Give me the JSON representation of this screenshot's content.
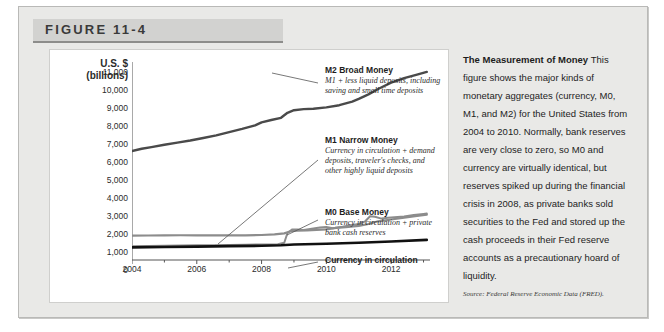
{
  "figure": {
    "label": "FIGURE 11-4"
  },
  "caption": {
    "heading": "The Measurement of",
    "heading2": "Money",
    "body": "This figure shows the major kinds of monetary aggregates (currency, M0, M1, and M2) for the United States from 2004 to 2010. Normally, bank reserves are very close to zero, so M0 and currency are virtually identical, but reserves spiked up during the financial crisis in 2008, as private banks sold securities to the Fed and stored up the cash proceeds in their Fed reserve accounts as a precautionary hoard of liquidity.",
    "source": "Source: Federal Reserve Economic Data (FRED)."
  },
  "callouts": [
    {
      "title": "M2 Broad Money",
      "desc": "M1 + less liquid deposits, including saving and small time deposits"
    },
    {
      "title": "M1 Narrow Money",
      "desc": "Currency in circulation + demand deposits, traveler's checks, and other highly liquid deposits"
    },
    {
      "title": "M0 Base Money",
      "desc": "Currency in circulation + private bank cash reserves"
    },
    {
      "title": "Currency in circulation",
      "desc": ""
    }
  ],
  "chart_data": {
    "type": "line",
    "title": "The Measurement of Money",
    "xlabel": "",
    "ylabel": "U.S. $ (billions)",
    "ylabel_line1": "U.S. $",
    "ylabel_line2": "(billions)",
    "xlim": [
      2004,
      2013.2
    ],
    "ylim": [
      0,
      11000
    ],
    "yticks": [
      0,
      1000,
      2000,
      3000,
      4000,
      5000,
      6000,
      7000,
      8000,
      9000,
      10000,
      11000
    ],
    "ytick_labels": [
      "0",
      "1,000",
      "2,000",
      "3,000",
      "4,000",
      "5,000",
      "6,000",
      "7,000",
      "8,000",
      "9,000",
      "10,000",
      "11,000"
    ],
    "xticks_major": [
      2004,
      2006,
      2008,
      2010,
      2012
    ],
    "xtick_labels": [
      "2004",
      "2006",
      "2008",
      "2010",
      "2012"
    ],
    "xticks_minor": [
      2005,
      2007,
      2009,
      2011,
      2013
    ],
    "grid": false,
    "legend": "inline-callouts",
    "colors": {
      "m2": "#4a4a4a",
      "m1": "#8c8c8c",
      "m0": "#8c8c8c",
      "currency": "#111111",
      "axis": "#555555",
      "panel_background": "#ffffff",
      "figure_background": "#e9e9e7",
      "header_background": "#d2d2d0"
    },
    "series": [
      {
        "name": "M2 Broad Money",
        "color": "#4a4a4a",
        "x": [
          2004.0,
          2004.3,
          2004.6,
          2005.0,
          2005.4,
          2005.8,
          2006.2,
          2006.6,
          2007.0,
          2007.4,
          2007.8,
          2008.0,
          2008.3,
          2008.6,
          2008.8,
          2009.0,
          2009.3,
          2009.6,
          2010.0,
          2010.4,
          2010.8,
          2011.0,
          2011.3,
          2011.6,
          2012.0,
          2012.4,
          2012.8,
          2013.1
        ],
        "values": [
          6050,
          6180,
          6270,
          6400,
          6520,
          6640,
          6780,
          6920,
          7100,
          7280,
          7480,
          7650,
          7780,
          7900,
          8180,
          8320,
          8380,
          8400,
          8480,
          8600,
          8800,
          8950,
          9200,
          9500,
          9850,
          10100,
          10300,
          10450
        ]
      },
      {
        "name": "M1 Narrow Money",
        "color": "#8c8c8c",
        "x": [
          2004.0,
          2004.5,
          2005.0,
          2005.5,
          2006.0,
          2006.5,
          2007.0,
          2007.5,
          2008.0,
          2008.4,
          2008.7,
          2008.9,
          2009.1,
          2009.4,
          2009.7,
          2010.0,
          2010.3,
          2010.6,
          2011.0,
          2011.3,
          2011.6,
          2012.0,
          2012.4,
          2012.8,
          2013.1
        ],
        "values": [
          1350,
          1360,
          1370,
          1375,
          1370,
          1365,
          1370,
          1370,
          1390,
          1420,
          1480,
          1600,
          1630,
          1650,
          1670,
          1700,
          1780,
          1830,
          1900,
          2000,
          2150,
          2250,
          2350,
          2450,
          2520
        ]
      },
      {
        "name": "M0 Base Money",
        "color": "#8c8c8c",
        "x": [
          2004.0,
          2004.5,
          2005.0,
          2005.5,
          2006.0,
          2006.5,
          2007.0,
          2007.5,
          2008.0,
          2008.5,
          2008.7,
          2008.8,
          2008.95,
          2009.1,
          2009.3,
          2009.5,
          2009.8,
          2010.0,
          2010.2,
          2010.5,
          2010.8,
          2011.0,
          2011.2,
          2011.35,
          2011.5,
          2011.7,
          2011.9,
          2012.1,
          2012.4,
          2012.7,
          2013.0,
          2013.1
        ],
        "values": [
          760,
          775,
          790,
          800,
          815,
          825,
          840,
          850,
          860,
          880,
          960,
          1500,
          1700,
          1700,
          1670,
          1720,
          1800,
          1830,
          1770,
          1850,
          1950,
          2000,
          2150,
          2430,
          2400,
          2300,
          2350,
          2380,
          2420,
          2500,
          2560,
          2580
        ]
      },
      {
        "name": "Currency in circulation",
        "color": "#111111",
        "x": [
          2004.0,
          2005.0,
          2006.0,
          2007.0,
          2008.0,
          2008.6,
          2009.0,
          2010.0,
          2011.0,
          2012.0,
          2013.1
        ],
        "values": [
          700,
          720,
          745,
          770,
          790,
          820,
          860,
          900,
          960,
          1030,
          1120
        ]
      }
    ]
  }
}
